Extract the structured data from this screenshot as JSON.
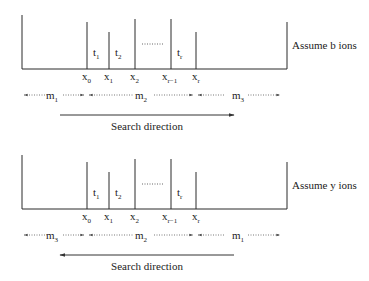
{
  "panels": [
    {
      "id": "b-ions",
      "label": "Assume b ions",
      "peaks": [
        "x0",
        "x1",
        "x2",
        "x(r-1)",
        "xr"
      ],
      "x_labels": [
        {
          "base": "x",
          "sub": "0"
        },
        {
          "base": "x",
          "sub": "1"
        },
        {
          "base": "x",
          "sub": "2"
        },
        {
          "base": "x",
          "sub": "r−1"
        },
        {
          "base": "x",
          "sub": "r"
        }
      ],
      "gap_labels": [
        {
          "base": "t",
          "sub": "1"
        },
        {
          "base": "t",
          "sub": "2"
        },
        {
          "base": "t",
          "sub": "r"
        }
      ],
      "segments": [
        {
          "base": "m",
          "sub": "1"
        },
        {
          "base": "m",
          "sub": "2"
        },
        {
          "base": "m",
          "sub": "3"
        }
      ],
      "search_direction_label": "Search direction",
      "search_direction": "right"
    },
    {
      "id": "y-ions",
      "label": "Assume y ions",
      "peaks": [
        "x0",
        "x1",
        "x2",
        "x(r-1)",
        "xr"
      ],
      "x_labels": [
        {
          "base": "x",
          "sub": "0"
        },
        {
          "base": "x",
          "sub": "1"
        },
        {
          "base": "x",
          "sub": "2"
        },
        {
          "base": "x",
          "sub": "r−1"
        },
        {
          "base": "x",
          "sub": "r"
        }
      ],
      "gap_labels": [
        {
          "base": "t",
          "sub": "1"
        },
        {
          "base": "t",
          "sub": "2"
        },
        {
          "base": "t",
          "sub": "r"
        }
      ],
      "segments": [
        {
          "base": "m",
          "sub": "3"
        },
        {
          "base": "m",
          "sub": "2"
        },
        {
          "base": "m",
          "sub": "1"
        }
      ],
      "search_direction_label": "Search direction",
      "search_direction": "left"
    }
  ],
  "colors": {
    "line": "#2a2a2a",
    "dotted": "#555555",
    "text": "#222222"
  }
}
